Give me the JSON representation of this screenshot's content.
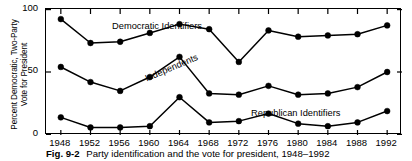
{
  "figure": {
    "caption_label": "Fig. 9-2",
    "caption_text": "Party identification and the vote for president, 1948–1992"
  },
  "axes": {
    "ylabel_line1": "Percent Democratic, Two-Party",
    "ylabel_line2": "Vote for President",
    "yticks": [
      "100",
      "50",
      "0"
    ],
    "xticks": [
      "1948",
      "1952",
      "1956",
      "1960",
      "1964",
      "1968",
      "1972",
      "1976",
      "1980",
      "1984",
      "1988",
      "1992"
    ]
  },
  "labels": {
    "democratic": "Democratic Identifiers",
    "independents": "Independents",
    "republican": "Republican Identifiers"
  },
  "colors": {
    "line": "#000000",
    "marker": "#000000",
    "frame": "#000000",
    "background": "#ffffff"
  },
  "chart_data": {
    "type": "line",
    "title": "Party identification and the vote for president, 1948–1992",
    "xlabel": "",
    "ylabel": "Percent Democratic, Two-Party Vote for President",
    "x": [
      1948,
      1952,
      1956,
      1960,
      1964,
      1968,
      1972,
      1976,
      1980,
      1984,
      1988,
      1992
    ],
    "xlim": [
      1946,
      1994
    ],
    "ylim": [
      0,
      100
    ],
    "yticks": [
      0,
      50,
      100
    ],
    "grid": false,
    "legend": "in-plot series labels",
    "series": [
      {
        "name": "Democratic Identifiers",
        "values": [
          92,
          73,
          74,
          81,
          88,
          84,
          58,
          83,
          78,
          79,
          80,
          87
        ],
        "marker": "filled-circle"
      },
      {
        "name": "Independents",
        "values": [
          54,
          42,
          35,
          46,
          62,
          33,
          32,
          39,
          32,
          33,
          38,
          50
        ],
        "marker": "filled-circle"
      },
      {
        "name": "Republican Identifiers",
        "values": [
          14,
          6,
          6,
          7,
          30,
          10,
          11,
          17,
          9,
          7,
          10,
          19
        ],
        "marker": "filled-circle"
      }
    ]
  }
}
